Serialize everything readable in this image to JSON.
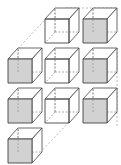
{
  "diagram": {
    "title": "",
    "colors": {
      "stroke": "#444444",
      "hidden_stroke": "#888888",
      "shade": "#d2d2d2",
      "white": "#ffffff",
      "guide": "#aaaaaa"
    },
    "cube": {
      "size": 24,
      "depth_dx": 10,
      "depth_dy": -11
    },
    "cubes": [
      {
        "id": "r1c2",
        "row": 1,
        "col": 2,
        "x": 45,
        "y": 19,
        "shaded": false
      },
      {
        "id": "r1c3",
        "row": 1,
        "col": 3,
        "x": 83,
        "y": 19,
        "shaded": true
      },
      {
        "id": "r2c1",
        "row": 2,
        "col": 1,
        "x": 8,
        "y": 59,
        "shaded": true
      },
      {
        "id": "r2c2",
        "row": 2,
        "col": 2,
        "x": 45,
        "y": 59,
        "shaded": false
      },
      {
        "id": "r2c3",
        "row": 2,
        "col": 3,
        "x": 83,
        "y": 59,
        "shaded": true
      },
      {
        "id": "r3c1",
        "row": 3,
        "col": 1,
        "x": 8,
        "y": 99,
        "shaded": true
      },
      {
        "id": "r3c2",
        "row": 3,
        "col": 2,
        "x": 45,
        "y": 99,
        "shaded": false
      },
      {
        "id": "r3c3",
        "row": 3,
        "col": 3,
        "x": 83,
        "y": 99,
        "shaded": true
      },
      {
        "id": "r4c1",
        "row": 4,
        "col": 1,
        "x": 8,
        "y": 139,
        "shaded": true
      }
    ],
    "guides": [
      {
        "id": "top-guide",
        "x1": 66,
        "y1": 8,
        "x2": 117,
        "y2": 8
      },
      {
        "id": "left-diagonal",
        "x1": 55,
        "y1": 9,
        "x2": 12,
        "y2": 55
      },
      {
        "id": "bottom-diagonal",
        "x1": 69,
        "y1": 122,
        "x2": 33,
        "y2": 160
      },
      {
        "id": "right-guide-1",
        "x1": 117,
        "y1": 48,
        "x2": 117,
        "y2": 88
      },
      {
        "id": "right-guide-2",
        "x1": 117,
        "y1": 88,
        "x2": 117,
        "y2": 128
      }
    ]
  }
}
